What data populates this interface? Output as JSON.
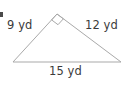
{
  "figure": {
    "kind": "right-triangle-diagram",
    "units": "yd",
    "background_color": "#ffffff",
    "stroke_color": "#a9a9a9",
    "text_color": "#3b3b3b",
    "stroke_width": 1,
    "vertices": {
      "left": {
        "x": 13,
        "y": 62
      },
      "apex": {
        "x": 57,
        "y": 14
      },
      "right": {
        "x": 121,
        "y": 62
      }
    },
    "right_angle_marker": {
      "at_vertex": "apex",
      "shape": "square",
      "size": 8
    },
    "sides": [
      {
        "id": "leg-a",
        "from": "left",
        "to": "apex",
        "label": "9 yd",
        "value": 9,
        "role": "leg"
      },
      {
        "id": "leg-b",
        "from": "apex",
        "to": "right",
        "label": "12 yd",
        "value": 12,
        "role": "leg"
      },
      {
        "id": "base",
        "from": "left",
        "to": "right",
        "label": "15 yd",
        "value": 15,
        "role": "hypotenuse"
      }
    ],
    "labels": {
      "leg_a": "9 yd",
      "leg_b": "12 yd",
      "base": "15 yd"
    }
  }
}
